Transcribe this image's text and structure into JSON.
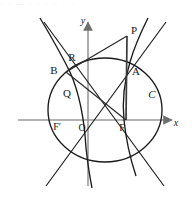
{
  "figure": {
    "kind": "geometry-diagram",
    "background_color": "#ffffff",
    "curve_color": "#1a1a1a",
    "axis_color": "#9a9a9a",
    "segment_color": "#3a3a3a",
    "label_color": "#1a1a1a",
    "artifact_text": "· · — · · · · · ·"
  },
  "axes": {
    "x_label": "x",
    "y_label": "y",
    "origin_label": "O",
    "x_axis_y": 120,
    "y_axis_x": 88,
    "x_range_px": [
      18,
      178
    ],
    "y_range_px": [
      18,
      186
    ]
  },
  "points": [
    {
      "name": "P",
      "label": "P",
      "x": 127,
      "y": 36,
      "lx": 131,
      "ly": 31,
      "italic": false
    },
    {
      "name": "A",
      "label": "A",
      "x": 126,
      "y": 73,
      "lx": 132,
      "ly": 72,
      "italic": false
    },
    {
      "name": "R",
      "label": "R",
      "x": 72,
      "y": 65,
      "lx": 72,
      "ly": 58,
      "italic": false
    },
    {
      "name": "B",
      "label": "B",
      "x": 66,
      "y": 72,
      "lx": 54,
      "ly": 71,
      "italic": false
    },
    {
      "name": "Q",
      "label": "Q",
      "x": 70,
      "y": 88,
      "lx": 67,
      "ly": 94,
      "italic": false
    },
    {
      "name": "C",
      "label": "C",
      "x": 156,
      "y": 96,
      "lx": 152,
      "ly": 95,
      "italic": true
    },
    {
      "name": "F-prime",
      "label": "F′",
      "x": 63,
      "y": 120,
      "lx": 57,
      "ly": 128,
      "italic": false
    },
    {
      "name": "O",
      "label": "O",
      "x": 88,
      "y": 120,
      "lx": 84,
      "ly": 129,
      "italic": false
    },
    {
      "name": "F",
      "label": "F",
      "x": 126,
      "y": 120,
      "lx": 122,
      "ly": 129,
      "italic": false
    }
  ],
  "ellipse": {
    "name": "ellipse-C",
    "label": "C",
    "cx": 105,
    "cy": 110,
    "rx": 57,
    "ry": 52
  },
  "hyperbola": {
    "name": "hyperbola",
    "left_branch_path": "M 40,18 C 52,38 62,56 70,72 C 78,90 84,114 86,148 C 88,166 90,178 92,188",
    "right_branch_path": "M 148,18 C 140,34 134,48 130,62 C 124,82 122,100 124,120 C 126,140 130,158 136,176",
    "center_x": 105,
    "center_y": 110
  },
  "asymptotes": [
    {
      "name": "asymptote-up-right",
      "x1": 46,
      "y1": 186,
      "x2": 166,
      "y2": 22
    },
    {
      "name": "asymptote-down-right",
      "x1": 44,
      "y1": 22,
      "x2": 164,
      "y2": 186
    }
  ],
  "segments": [
    {
      "name": "segment-PF",
      "from": "P",
      "to": "F",
      "x1": 127,
      "y1": 36,
      "x2": 126,
      "y2": 120
    },
    {
      "name": "segment-PB",
      "from": "P",
      "to": "B",
      "x1": 127,
      "y1": 36,
      "x2": 66,
      "y2": 72
    },
    {
      "name": "segment-BF",
      "from": "B",
      "to": "F",
      "x1": 66,
      "y1": 72,
      "x2": 126,
      "y2": 120
    }
  ]
}
